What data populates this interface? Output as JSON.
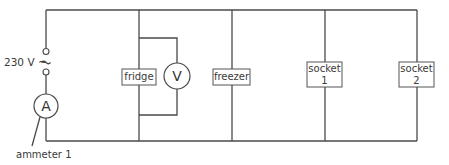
{
  "diagram": {
    "type": "circuit",
    "supply": {
      "label": "230 V ~"
    },
    "meters": [
      {
        "id": "ammeter",
        "symbol": "A",
        "annotation": "ammeter 1"
      },
      {
        "id": "voltmeter",
        "symbol": "V"
      }
    ],
    "components": [
      {
        "id": "fridge",
        "lines": [
          "fridge"
        ]
      },
      {
        "id": "freezer",
        "lines": [
          "freezer"
        ]
      },
      {
        "id": "socket1",
        "lines": [
          "socket",
          "1"
        ]
      },
      {
        "id": "socket2",
        "lines": [
          "socket",
          "2"
        ]
      }
    ],
    "colors": {
      "wire": "#4a4a4a",
      "text": "#3a3a3a",
      "background": "#ffffff"
    }
  }
}
